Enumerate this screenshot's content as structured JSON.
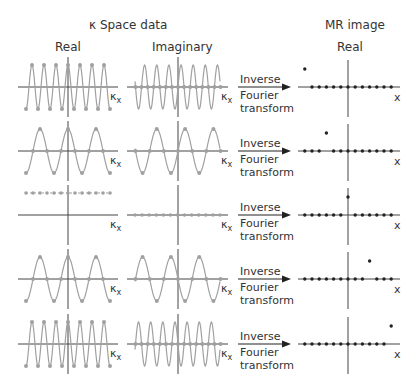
{
  "headers": {
    "kspace_title": "κ Space data",
    "real_label": "Real",
    "imag_label": "Imaginary",
    "mr_title": "MR image",
    "mr_real_label": "Real"
  },
  "arrow_text": {
    "line1": "Inverse",
    "line2": "Fourier",
    "line3": "transform"
  },
  "axis_labels": {
    "kx": "κ",
    "kx_sub": "x",
    "x": "x"
  },
  "colors": {
    "curve": "#a0a0a0",
    "sample_point": "#a0a0a0",
    "axis": "#444444",
    "mr_point": "#222222",
    "text": "#333333"
  },
  "chart_data": {
    "type": "diagram",
    "rows": [
      {
        "freq_cycles": 7,
        "phase": "cos",
        "real_shape": "cosine",
        "imag_shape": "sine",
        "mr_point_position": -6
      },
      {
        "freq_cycles": 3,
        "phase": "cos",
        "real_shape": "cosine",
        "imag_shape": "sine",
        "mr_point_position": -3
      },
      {
        "freq_cycles": 0,
        "phase": "dc",
        "real_shape": "constant",
        "imag_shape": "zero",
        "mr_point_position": 0
      },
      {
        "freq_cycles": 3,
        "phase": "cos",
        "real_shape": "cosine",
        "imag_shape": "-sine",
        "mr_point_position": 3
      },
      {
        "freq_cycles": 7,
        "phase": "cos",
        "real_shape": "cosine",
        "imag_shape": "-sine",
        "mr_point_position": 6
      }
    ],
    "mr_points_per_row": 13
  }
}
